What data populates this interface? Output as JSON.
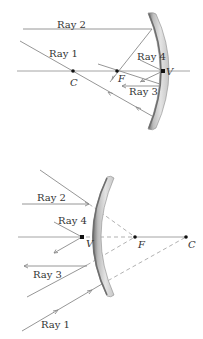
{
  "figure": {
    "concave": {
      "title": "Concave mirror principal rays",
      "labels": {
        "ray1": "Ray 1",
        "ray2": "Ray 2",
        "ray3": "Ray 3",
        "ray4": "Ray 4",
        "center": "C",
        "focus": "F",
        "vertex": "V"
      },
      "colors": {
        "mirror_fill": "#d4d4d4",
        "mirror_edge": "#6e6e6e",
        "ray": "#8a8a8a",
        "point": "#111111"
      }
    },
    "convex": {
      "title": "Convex mirror principal rays",
      "labels": {
        "ray1": "Ray 1",
        "ray2": "Ray 2",
        "ray3": "Ray 3",
        "ray4": "Ray 4",
        "center": "C",
        "focus": "F",
        "vertex": "V"
      },
      "colors": {
        "mirror_fill": "#d4d4d4",
        "mirror_edge": "#6e6e6e",
        "ray": "#8a8a8a",
        "dashed_extension": "#a8a8a8",
        "point": "#111111"
      }
    }
  }
}
